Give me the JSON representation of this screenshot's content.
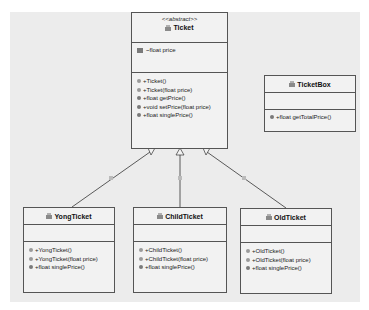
{
  "diagram": {
    "type": "UML class diagram",
    "classes": [
      {
        "id": "ticket",
        "stereotype": "<<abstract>>",
        "name": "Ticket",
        "attributes": [
          "~float price"
        ],
        "methods": [
          "+Ticket()",
          "+Ticket(float price)",
          "+float getPrice()",
          "+void setPrice(float price)",
          "+float singlePrice()"
        ]
      },
      {
        "id": "ticketbox",
        "name": "TicketBox",
        "attributes": [],
        "methods": [
          "+float getTotalPrice()"
        ]
      },
      {
        "id": "yongticket",
        "name": "YongTicket",
        "attributes": [],
        "methods": [
          "+YongTicket()",
          "+YongTicket(float price)",
          "+float singlePrice()"
        ]
      },
      {
        "id": "childticket",
        "name": "ChildTicket",
        "attributes": [],
        "methods": [
          "+ChildTicket()",
          "+ChildTicket(float price)",
          "+float singlePrice()"
        ]
      },
      {
        "id": "oldticket",
        "name": "OldTicket",
        "attributes": [],
        "methods": [
          "+OldTicket()",
          "+OldTicket(float price)",
          "+float singlePrice()"
        ]
      }
    ],
    "relations": [
      {
        "from": "YongTicket",
        "to": "Ticket",
        "kind": "generalization",
        "label": "is"
      },
      {
        "from": "ChildTicket",
        "to": "Ticket",
        "kind": "generalization",
        "label": "is"
      },
      {
        "from": "OldTicket",
        "to": "Ticket",
        "kind": "generalization",
        "label": "is"
      }
    ],
    "colors": {
      "canvas": "#ececec",
      "class_fill": "#f2f2f2",
      "border": "#555555"
    }
  },
  "ticket": {
    "stereotype": "<<abstract>>",
    "name": "Ticket",
    "attributes": [
      "~float price"
    ],
    "methods": [
      "+Ticket()",
      "+Ticket(float price)",
      "+float getPrice()",
      "+void setPrice(float price)",
      "+float singlePrice()"
    ]
  },
  "ticketbox": {
    "name": "TicketBox",
    "methods": [
      "+float getTotalPrice()"
    ]
  },
  "yong": {
    "name": "YongTicket",
    "methods": [
      "+YongTicket()",
      "+YongTicket(float price)",
      "+float singlePrice()"
    ]
  },
  "child": {
    "name": "ChildTicket",
    "methods": [
      "+ChildTicket()",
      "+ChildTicket(float price)",
      "+float singlePrice()"
    ]
  },
  "old": {
    "name": "OldTicket",
    "methods": [
      "+OldTicket()",
      "+OldTicket(float price)",
      "+float singlePrice()"
    ]
  },
  "labels": {
    "rel1": "is",
    "rel2": "is",
    "rel3": "is"
  }
}
